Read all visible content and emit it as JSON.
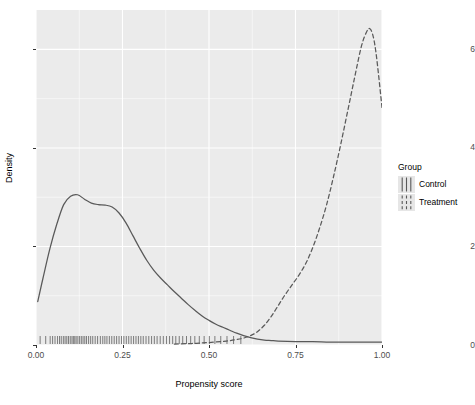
{
  "chart_data": {
    "type": "line",
    "title": "",
    "xlabel": "Propensity score",
    "ylabel": "Density",
    "xlim": [
      0.0,
      1.0
    ],
    "ylim": [
      0.0,
      6.8
    ],
    "xticks": [
      0.0,
      0.25,
      0.5,
      0.75,
      1.0
    ],
    "xticklabels": [
      "0.00",
      "0.25",
      "0.50",
      "0.75",
      "1.00"
    ],
    "yticks": [
      0,
      2,
      4,
      6
    ],
    "yticklabels": [
      "0",
      "2",
      "4",
      "6"
    ],
    "grid": true,
    "grid_color": "#FFFFFF",
    "panel_background": "#EBEBEB",
    "legend": {
      "title": "Group",
      "position": "right",
      "entries": [
        {
          "name": "Control",
          "linestyle": "solid",
          "color": "#595959"
        },
        {
          "name": "Treatment",
          "linestyle": "dashed",
          "color": "#595959"
        }
      ]
    },
    "series": [
      {
        "name": "Control",
        "linestyle": "solid",
        "color": "#595959",
        "x": [
          0.005,
          0.02,
          0.04,
          0.06,
          0.08,
          0.1,
          0.12,
          0.14,
          0.16,
          0.18,
          0.2,
          0.22,
          0.24,
          0.26,
          0.28,
          0.3,
          0.32,
          0.34,
          0.36,
          0.38,
          0.4,
          0.42,
          0.44,
          0.46,
          0.48,
          0.5,
          0.52,
          0.54,
          0.56,
          0.58,
          0.6,
          0.62,
          0.64,
          0.66,
          0.68,
          0.7,
          0.75,
          0.8,
          0.85,
          0.9,
          0.95,
          1.0
        ],
        "y": [
          0.88,
          1.35,
          1.95,
          2.45,
          2.85,
          3.02,
          3.05,
          2.96,
          2.88,
          2.85,
          2.84,
          2.8,
          2.68,
          2.48,
          2.22,
          1.96,
          1.72,
          1.52,
          1.36,
          1.22,
          1.08,
          0.95,
          0.82,
          0.7,
          0.59,
          0.5,
          0.42,
          0.36,
          0.3,
          0.24,
          0.19,
          0.15,
          0.12,
          0.1,
          0.09,
          0.08,
          0.07,
          0.07,
          0.06,
          0.06,
          0.06,
          0.06
        ]
      },
      {
        "name": "Treatment",
        "linestyle": "dashed",
        "color": "#595959",
        "x": [
          0.4,
          0.45,
          0.5,
          0.55,
          0.58,
          0.6,
          0.62,
          0.64,
          0.66,
          0.68,
          0.7,
          0.72,
          0.74,
          0.76,
          0.78,
          0.8,
          0.82,
          0.84,
          0.86,
          0.88,
          0.9,
          0.92,
          0.94,
          0.955,
          0.965,
          0.975,
          0.985,
          1.0
        ],
        "y": [
          0.02,
          0.03,
          0.05,
          0.08,
          0.11,
          0.14,
          0.19,
          0.27,
          0.4,
          0.58,
          0.8,
          1.02,
          1.22,
          1.42,
          1.66,
          1.98,
          2.38,
          2.85,
          3.42,
          4.05,
          4.72,
          5.4,
          6.05,
          6.35,
          6.42,
          6.25,
          5.8,
          4.82
        ]
      }
    ],
    "rug": {
      "control": {
        "row": "upper",
        "linestyle": "mixed",
        "values": [
          0.012,
          0.028,
          0.041,
          0.048,
          0.055,
          0.062,
          0.068,
          0.073,
          0.079,
          0.084,
          0.089,
          0.094,
          0.099,
          0.104,
          0.108,
          0.112,
          0.116,
          0.121,
          0.126,
          0.131,
          0.136,
          0.141,
          0.146,
          0.152,
          0.158,
          0.164,
          0.171,
          0.178,
          0.186,
          0.193,
          0.199,
          0.205,
          0.212,
          0.219,
          0.226,
          0.233,
          0.24,
          0.247,
          0.254,
          0.261,
          0.268,
          0.275,
          0.282,
          0.289,
          0.296,
          0.303,
          0.31,
          0.318,
          0.326,
          0.334,
          0.342,
          0.35,
          0.359,
          0.368,
          0.377,
          0.386,
          0.395,
          0.404,
          0.414,
          0.424,
          0.435,
          0.447,
          0.459,
          0.472,
          0.486,
          0.501,
          0.517,
          0.534,
          0.552,
          0.571,
          0.592
        ]
      },
      "treatment": {
        "row": "lower",
        "linestyle": "solid",
        "values": [
          0.672,
          0.688,
          0.701,
          0.713,
          0.724,
          0.734,
          0.744,
          0.753,
          0.762,
          0.771,
          0.779,
          0.787,
          0.795,
          0.802,
          0.81,
          0.817,
          0.824,
          0.831,
          0.837,
          0.844,
          0.85,
          0.856,
          0.862,
          0.868,
          0.874,
          0.879,
          0.885,
          0.89,
          0.895,
          0.9,
          0.905,
          0.91,
          0.915,
          0.919,
          0.924,
          0.928,
          0.932,
          0.936,
          0.94,
          0.944,
          0.947,
          0.951,
          0.954,
          0.957,
          0.96,
          0.963,
          0.966,
          0.969,
          0.971,
          0.974,
          0.976,
          0.978,
          0.98,
          0.982,
          0.984,
          0.986,
          0.988,
          0.99,
          0.992,
          0.994,
          0.996,
          0.998,
          1.0
        ]
      }
    }
  }
}
